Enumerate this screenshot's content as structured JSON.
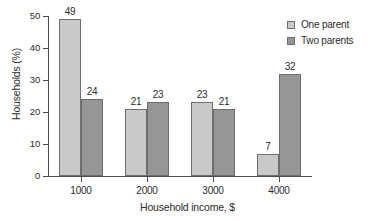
{
  "chart_data": {
    "type": "bar",
    "title": "",
    "xlabel": "Household income, $",
    "ylabel": "Households (%)",
    "categories": [
      "1000",
      "2000",
      "3000",
      "4000"
    ],
    "series": [
      {
        "name": "One parent",
        "color": "#c9c9c9",
        "values": [
          49,
          21,
          23,
          7
        ]
      },
      {
        "name": "Two parents",
        "color": "#969696",
        "values": [
          24,
          23,
          21,
          32
        ]
      }
    ],
    "ylim": [
      0,
      50
    ],
    "yticks": [
      0,
      10,
      20,
      30,
      40,
      50
    ],
    "grid": false,
    "legend_position": "top-right",
    "value_labels": true
  },
  "legend": {
    "entries": [
      {
        "label": "One parent"
      },
      {
        "label": "Two parents"
      }
    ]
  }
}
